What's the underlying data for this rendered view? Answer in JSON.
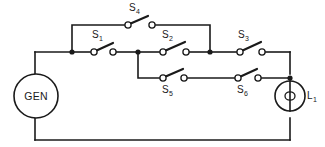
{
  "figure": {
    "kind": "electrical-schematic",
    "background_color": "#ffffff",
    "line_color": "#1a1a1a"
  },
  "source": {
    "name": "GEN",
    "full_label": "GEN",
    "type": "generator",
    "symbol": "circle"
  },
  "load": {
    "name": "L",
    "subscript": "1",
    "full_label": "L1",
    "type": "lamp",
    "symbol": "circle-with-filament-loop"
  },
  "switches": [
    {
      "id": "S1",
      "name": "S",
      "subscript": "1",
      "state": "open",
      "label_position": "above",
      "branch": "main-row"
    },
    {
      "id": "S2",
      "name": "S",
      "subscript": "2",
      "state": "open",
      "label_position": "above",
      "branch": "main-row"
    },
    {
      "id": "S3",
      "name": "S",
      "subscript": "3",
      "state": "open",
      "label_position": "above",
      "branch": "main-row"
    },
    {
      "id": "S4",
      "name": "S",
      "subscript": "4",
      "state": "open",
      "label_position": "above",
      "branch": "top-bypass"
    },
    {
      "id": "S5",
      "name": "S",
      "subscript": "5",
      "state": "open",
      "label_position": "below",
      "branch": "lower-bypass"
    },
    {
      "id": "S6",
      "name": "S",
      "subscript": "6",
      "state": "open",
      "label_position": "below",
      "branch": "lower-bypass"
    }
  ],
  "junctions": [
    {
      "id": "node-a",
      "x": 72,
      "y": 52
    },
    {
      "id": "node-b",
      "x": 138,
      "y": 52
    },
    {
      "id": "node-c",
      "x": 210,
      "y": 52
    },
    {
      "id": "node-d",
      "x": 290,
      "y": 78
    }
  ]
}
